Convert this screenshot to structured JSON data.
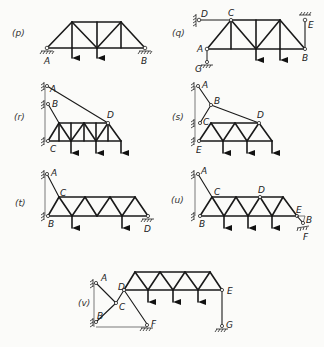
{
  "figure": {
    "panels": [
      {
        "id": "p",
        "label": "(p)",
        "nodes": [
          "A",
          "B"
        ]
      },
      {
        "id": "q",
        "label": "(q)",
        "nodes": [
          "D",
          "C",
          "E",
          "A",
          "B",
          "G"
        ]
      },
      {
        "id": "r",
        "label": "(r)",
        "nodes": [
          "A",
          "B",
          "D",
          "C"
        ]
      },
      {
        "id": "s",
        "label": "(s)",
        "nodes": [
          "A",
          "B",
          "C",
          "D",
          "E"
        ]
      },
      {
        "id": "t",
        "label": "(t)",
        "nodes": [
          "A",
          "C",
          "B",
          "D"
        ]
      },
      {
        "id": "u",
        "label": "(u)",
        "nodes": [
          "A",
          "C",
          "D",
          "E",
          "B",
          "F"
        ]
      },
      {
        "id": "v",
        "label": "(v)",
        "nodes": [
          "A",
          "D",
          "C",
          "B",
          "F",
          "E",
          "G"
        ]
      }
    ]
  },
  "labels": {
    "p": {
      "panel": "(p)",
      "A": "A",
      "B": "B"
    },
    "q": {
      "panel": "(q)",
      "D": "D",
      "C": "C",
      "E": "E",
      "A": "A",
      "B": "B",
      "G": "G"
    },
    "r": {
      "panel": "(r)",
      "A": "A",
      "B": "B",
      "D": "D",
      "C": "C"
    },
    "s": {
      "panel": "(s)",
      "A": "A",
      "B": "B",
      "C": "C",
      "D": "D",
      "E": "E"
    },
    "t": {
      "panel": "(t)",
      "A": "A",
      "C": "C",
      "B": "B",
      "D": "D"
    },
    "u": {
      "panel": "(u)",
      "A": "A",
      "C": "C",
      "D": "D",
      "E": "E",
      "B": "B",
      "F": "F"
    },
    "v": {
      "panel": "(v)",
      "A": "A",
      "D": "D",
      "C": "C",
      "B": "B",
      "F": "F",
      "E": "E",
      "G": "G"
    }
  },
  "colors": {
    "ink": "#1a1a1a",
    "paper": "#fbfbf9"
  }
}
